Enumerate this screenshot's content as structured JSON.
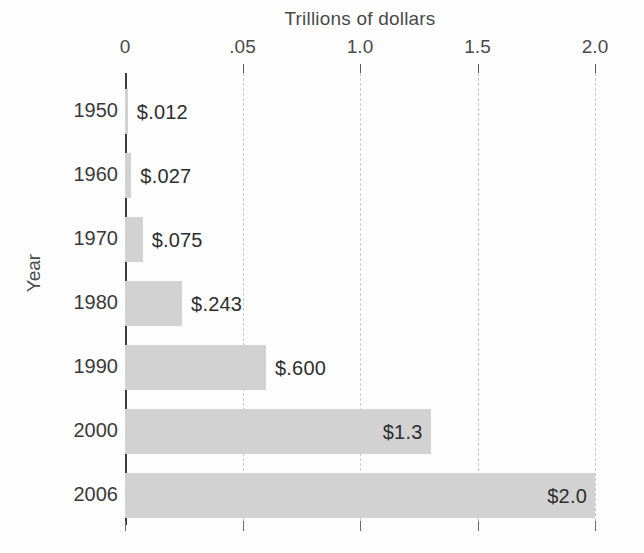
{
  "chart_data": {
    "type": "bar",
    "orientation": "horizontal",
    "title": "Trillions of dollars",
    "xlabel": "Trillions of dollars",
    "ylabel": "Year",
    "categories": [
      "1950",
      "1960",
      "1970",
      "1980",
      "1990",
      "2000",
      "2006"
    ],
    "values": [
      0.012,
      0.027,
      0.075,
      0.243,
      0.6,
      1.3,
      2.0
    ],
    "value_labels": [
      "$.012",
      "$.027",
      "$.075",
      "$.243",
      "$.600",
      "$1.3",
      "$2.0"
    ],
    "label_placement": [
      "outside",
      "outside",
      "outside",
      "outside",
      "outside",
      "inside",
      "inside"
    ],
    "xlim": [
      0,
      2.0
    ],
    "xticks": [
      0,
      0.5,
      1.0,
      1.5,
      2.0
    ],
    "xtick_labels": [
      "0",
      ".05",
      "1.0",
      "1.5",
      "2.0"
    ],
    "grid": true,
    "grid_style": "dashed-vertical",
    "legend": null,
    "bar_color": "#d2d2d2",
    "axis_color": "#3c3c3c",
    "grid_color": "#c9c9c9",
    "background": "#fefefe",
    "series": [
      {
        "name": "Trillions of dollars",
        "values": [
          0.012,
          0.027,
          0.075,
          0.243,
          0.6,
          1.3,
          2.0
        ]
      }
    ]
  }
}
